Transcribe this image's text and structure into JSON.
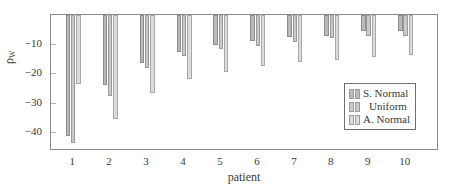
{
  "chart_data": {
    "type": "bar",
    "title": "",
    "xlabel": "patient",
    "ylabel": "ρ_W",
    "ylabel_base": "ρ",
    "ylabel_sub": "W",
    "categories": [
      "1",
      "2",
      "3",
      "4",
      "5",
      "6",
      "7",
      "8",
      "9",
      "10"
    ],
    "series": [
      {
        "name": "S. Normal",
        "color": "#b9b9b9",
        "values": [
          -41.2,
          -24.0,
          -16.3,
          -12.6,
          -10.2,
          -8.8,
          -7.5,
          -7.2,
          -5.6,
          -5.4
        ]
      },
      {
        "name": "Uniform",
        "color": "#c9c9c9",
        "values": [
          -43.9,
          -27.6,
          -18.2,
          -14.0,
          -11.6,
          -10.6,
          -9.2,
          -8.0,
          -7.3,
          -7.1
        ]
      },
      {
        "name": "A. Normal",
        "color": "#dcdcdc",
        "values": [
          -23.6,
          -35.6,
          -26.6,
          -21.9,
          -19.5,
          -17.6,
          -16.0,
          -15.3,
          -14.2,
          -13.6
        ]
      }
    ],
    "yticks": [
      -10,
      -20,
      -30,
      -40
    ],
    "ytick_labels": [
      "−10",
      "−20",
      "−30",
      "−40"
    ],
    "ylim": [
      -46.5,
      0
    ],
    "xlim": [
      0.4,
      10.9
    ],
    "grid": false,
    "legend_position": "lower right"
  }
}
